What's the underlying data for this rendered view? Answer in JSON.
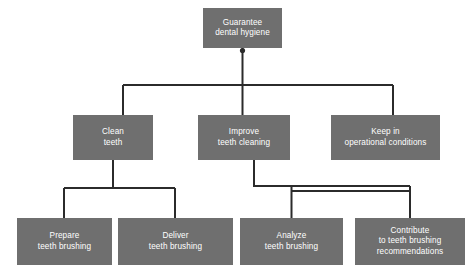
{
  "diagram": {
    "type": "goal-breakdown-tree",
    "orientation": "top-down",
    "background_color": "#ffffff",
    "node_fill_color": "#6f6f6f",
    "node_text_color": "#ffffff",
    "connector_color": "#2b2b2b",
    "connector_width_px": 2,
    "canvas": {
      "width": 474,
      "height": 270
    }
  },
  "nodes": {
    "root": {
      "label": "Guarantee\ndental hygiene",
      "level": 1
    },
    "level2": [
      {
        "id": "clean-teeth",
        "label": "Clean\nteeth",
        "level": 2
      },
      {
        "id": "improve-teeth-cleaning",
        "label": "Improve\nteeth cleaning",
        "level": 2
      },
      {
        "id": "keep-operational",
        "label": "Keep in\noperational conditions",
        "level": 2
      }
    ],
    "level3": [
      {
        "id": "prepare-brushing",
        "label": "Prepare\nteeth brushing",
        "level": 3,
        "parent": "clean-teeth"
      },
      {
        "id": "deliver-brushing",
        "label": "Deliver\nteeth brushing",
        "level": 3,
        "parent": "clean-teeth"
      },
      {
        "id": "analyze-brushing",
        "label": "Analyze\nteeth brushing",
        "level": 3,
        "parent": "improve-teeth-cleaning"
      },
      {
        "id": "contribute-recommendations",
        "label": "Contribute\nto teeth brushing\nrecommendations",
        "level": 3,
        "parent": "improve-teeth-cleaning"
      }
    ]
  },
  "edges": [
    {
      "from": "root",
      "to": "clean-teeth"
    },
    {
      "from": "root",
      "to": "improve-teeth-cleaning"
    },
    {
      "from": "root",
      "to": "keep-operational"
    },
    {
      "from": "clean-teeth",
      "to": "prepare-brushing"
    },
    {
      "from": "clean-teeth",
      "to": "deliver-brushing"
    },
    {
      "from": "improve-teeth-cleaning",
      "to": "analyze-brushing"
    },
    {
      "from": "improve-teeth-cleaning",
      "to": "contribute-recommendations"
    }
  ]
}
